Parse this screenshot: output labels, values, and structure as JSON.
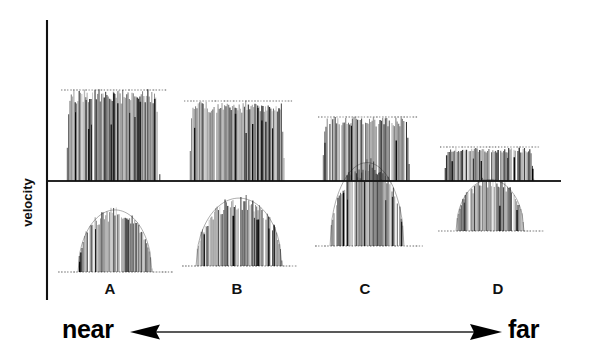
{
  "figure": {
    "axis_label_y": "velocity",
    "axis_left_x": 47,
    "axis_top_y": 20,
    "axis_bottom_y": 300,
    "zero_line_y": 181,
    "zero_line_x_start": 47,
    "zero_line_x_end": 561,
    "ink_color": "#111111",
    "dotted_color": "#555555",
    "background": "#ffffff"
  },
  "scale_axis": {
    "left_label": "near",
    "right_label": "far",
    "arrow_line_y": 332,
    "arrow_line_x_start": 152,
    "arrow_line_x_end": 478,
    "left_arrow_direction": "left",
    "right_arrow_direction": "right"
  },
  "cluster_labels": [
    {
      "label": "A",
      "x": 110,
      "y": 288
    },
    {
      "label": "B",
      "x": 237,
      "y": 288
    },
    {
      "label": "C",
      "x": 365,
      "y": 288
    },
    {
      "label": "D",
      "x": 498,
      "y": 288
    }
  ],
  "chart_data": {
    "type": "line",
    "title": "",
    "xlabel": "near ↔ far",
    "ylabel": "velocity",
    "grid": false,
    "legend_position": "none",
    "categories": [
      "A",
      "B",
      "C",
      "D"
    ],
    "series": [
      {
        "name": "upper burst peak (positive velocity, dotted ceiling)",
        "values": [
          91,
          102,
          118,
          148
        ]
      },
      {
        "name": "lower burst trough (negative velocity, dotted floor)",
        "values": [
          272,
          266,
          246,
          231
        ]
      }
    ],
    "bursts": [
      {
        "id": "A",
        "x_left": 66,
        "x_right": 160,
        "upper": {
          "shape": "flat-top",
          "top_y": 91,
          "base_y": 181,
          "dotted_y": 90,
          "dotted_x_left": 61,
          "dotted_x_right": 166
        },
        "lower": {
          "shape": "dome",
          "peak_y": 208,
          "base_y": 272,
          "dotted_y": 272,
          "dotted_x_left": 58,
          "dotted_x_right": 172,
          "x_left": 78,
          "x_right": 152
        }
      },
      {
        "id": "B",
        "x_left": 189,
        "x_right": 285,
        "upper": {
          "shape": "flat-top",
          "top_y": 102,
          "base_y": 181,
          "dotted_y": 101,
          "dotted_x_left": 184,
          "dotted_x_right": 292
        },
        "lower": {
          "shape": "dome",
          "peak_y": 196,
          "base_y": 266,
          "dotted_y": 266,
          "dotted_x_left": 182,
          "dotted_x_right": 296,
          "x_left": 196,
          "x_right": 282
        }
      },
      {
        "id": "C",
        "x_left": 322,
        "x_right": 410,
        "upper": {
          "shape": "flat-top",
          "top_y": 118,
          "base_y": 181,
          "dotted_y": 117,
          "dotted_x_left": 318,
          "dotted_x_right": 417
        },
        "lower": {
          "shape": "dome",
          "peak_y": 160,
          "base_y": 246,
          "dotted_y": 246,
          "dotted_x_left": 315,
          "dotted_x_right": 422,
          "x_left": 330,
          "x_right": 404
        }
      },
      {
        "id": "D",
        "x_left": 444,
        "x_right": 534,
        "upper": {
          "shape": "flat-top",
          "top_y": 148,
          "base_y": 181,
          "dotted_y": 147,
          "dotted_x_left": 440,
          "dotted_x_right": 539
        },
        "lower": {
          "shape": "dome",
          "peak_y": 178,
          "base_y": 231,
          "dotted_y": 231,
          "dotted_x_left": 438,
          "dotted_x_right": 543,
          "x_left": 456,
          "x_right": 524
        }
      }
    ]
  }
}
